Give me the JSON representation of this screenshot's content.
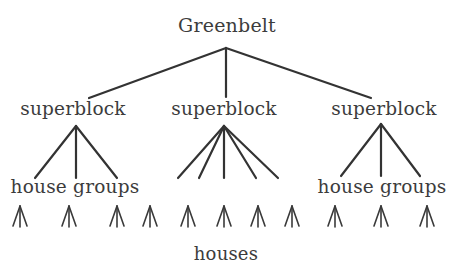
{
  "diagram": {
    "type": "hierarchy-tree",
    "root": {
      "label": "Greenbelt",
      "hub": [
        226,
        48
      ]
    },
    "superblocks": [
      {
        "label": "superblock",
        "label_x": 16,
        "anchor": [
          89,
          98
        ],
        "hub": [
          76,
          126
        ],
        "children": [
          [
            35,
            178
          ],
          [
            76,
            178
          ],
          [
            117,
            178
          ]
        ],
        "group_label": "house groups",
        "group_label_x": 7
      },
      {
        "label": "superblock",
        "label_x": 167,
        "anchor": [
          226,
          97
        ],
        "hub": [
          224,
          126
        ],
        "children": [
          [
            178,
            178
          ],
          [
            199,
            178
          ],
          [
            224,
            178
          ],
          [
            256,
            178
          ],
          [
            278,
            178
          ]
        ],
        "group_label": "",
        "group_label_x": 0
      },
      {
        "label": "superblock",
        "label_x": 327,
        "anchor": [
          371,
          98
        ],
        "hub": [
          381,
          124
        ],
        "children": [
          [
            341,
            176
          ],
          [
            381,
            176
          ],
          [
            420,
            176
          ]
        ],
        "group_label": "house groups",
        "group_label_x": 314
      }
    ],
    "houses": {
      "label": "houses",
      "tips_x": [
        20,
        69,
        117,
        150,
        188,
        224,
        258,
        292,
        335,
        381,
        427
      ],
      "tip_y": 206,
      "base_y": 226,
      "half_width": 7
    }
  }
}
